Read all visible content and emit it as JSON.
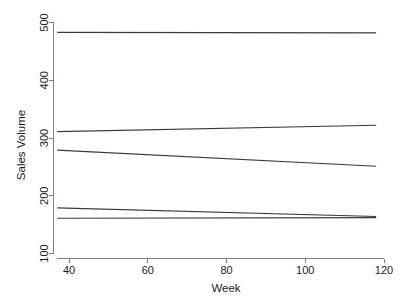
{
  "chart_data": {
    "type": "line",
    "title": "",
    "xlabel": "Week",
    "ylabel": "Sales Volume",
    "xlim": [
      36,
      119
    ],
    "ylim": [
      95,
      505
    ],
    "xticks": [
      40,
      60,
      80,
      100,
      120
    ],
    "xtick_labels": [
      "40",
      "60",
      "80",
      "100",
      "120"
    ],
    "yticks": [
      100,
      200,
      300,
      400,
      500
    ],
    "ytick_labels": [
      "100",
      "200",
      "300",
      "400",
      "500"
    ],
    "grid": false,
    "legend": "none",
    "x": [
      37,
      118
    ],
    "series": [
      {
        "name": "series-1",
        "values": [
          483,
          482
        ]
      },
      {
        "name": "series-2",
        "values": [
          311,
          322
        ]
      },
      {
        "name": "series-3",
        "values": [
          279,
          251
        ]
      },
      {
        "name": "series-4",
        "values": [
          179,
          164
        ]
      },
      {
        "name": "series-5",
        "values": [
          161,
          162
        ]
      }
    ],
    "line_color": "#3a3a3a",
    "axis_color": "#808080",
    "background_color": "#ffffff"
  },
  "axes": {
    "x_axis_title": "Week",
    "y_axis_title": "Sales Volume"
  }
}
